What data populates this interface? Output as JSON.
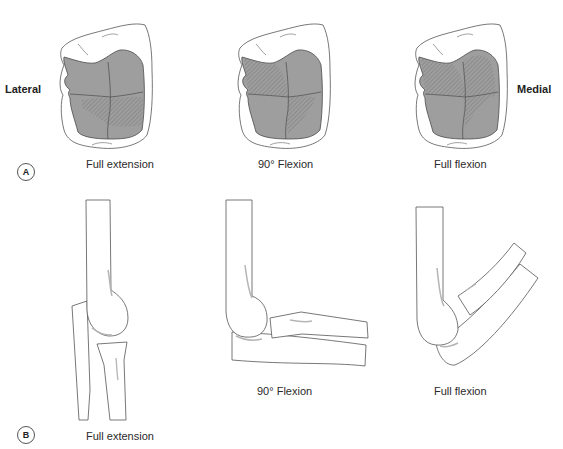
{
  "panel_a": {
    "badge": "A",
    "side_labels": {
      "left": "Lateral",
      "right": "Medial"
    },
    "figures": [
      {
        "id": "full-extension",
        "caption": "Full extension"
      },
      {
        "id": "90-flexion",
        "caption": "90° Flexion"
      },
      {
        "id": "full-flexion",
        "caption": "Full flexion"
      }
    ]
  },
  "panel_b": {
    "badge": "B",
    "figures": [
      {
        "id": "full-extension",
        "caption": "Full extension"
      },
      {
        "id": "90-flexion",
        "caption": "90° Flexion"
      },
      {
        "id": "full-flexion",
        "caption": "Full flexion"
      }
    ]
  },
  "colors": {
    "outline": "#555555",
    "articular_fill": "#9e9e9e",
    "hatch": "#6f6f6f",
    "bone_fill": "#ffffff",
    "shadow": "#b5b5b5"
  }
}
